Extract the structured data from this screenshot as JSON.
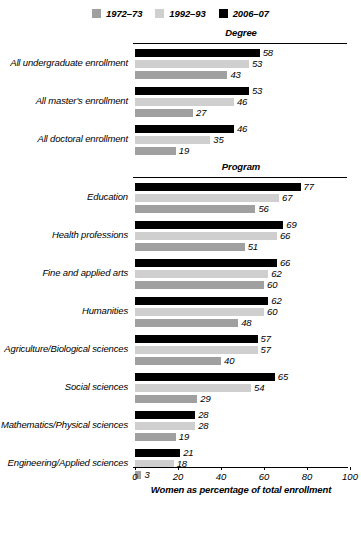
{
  "chart_data": {
    "type": "bar",
    "orientation": "horizontal",
    "title": "",
    "xlabel": "Women as percentage of total enrollment",
    "ylabel": "",
    "xlim": [
      0,
      100
    ],
    "xticks": [
      0,
      20,
      40,
      60,
      80,
      100
    ],
    "grid": false,
    "legend_position": "top-center",
    "series": [
      {
        "name": "1972–73",
        "color": "#a0a0a0",
        "order": 2
      },
      {
        "name": "1992–93",
        "color": "#cfcfcf",
        "order": 1
      },
      {
        "name": "2006–07",
        "color": "#000000",
        "order": 0
      }
    ],
    "sections": [
      {
        "title": "Degree",
        "categories": [
          {
            "label": "All undergraduate enrollment",
            "values": {
              "2006–07": 58,
              "1992–93": 53,
              "1972–73": 43
            }
          },
          {
            "label": "All master's enrollment",
            "values": {
              "2006–07": 53,
              "1992–93": 46,
              "1972–73": 27
            }
          },
          {
            "label": "All doctoral enrollment",
            "values": {
              "2006–07": 46,
              "1992–93": 35,
              "1972–73": 19
            }
          }
        ]
      },
      {
        "title": "Program",
        "categories": [
          {
            "label": "Education",
            "values": {
              "2006–07": 77,
              "1992–93": 67,
              "1972–73": 56
            }
          },
          {
            "label": "Health professions",
            "values": {
              "2006–07": 69,
              "1992–93": 66,
              "1972–73": 51
            }
          },
          {
            "label": "Fine and applied arts",
            "values": {
              "2006–07": 66,
              "1992–93": 62,
              "1972–73": 60
            }
          },
          {
            "label": "Humanities",
            "values": {
              "2006–07": 62,
              "1992–93": 60,
              "1972–73": 48
            }
          },
          {
            "label": "Agriculture/Biological sciences",
            "values": {
              "2006–07": 57,
              "1992–93": 57,
              "1972–73": 40
            }
          },
          {
            "label": "Social sciences",
            "values": {
              "2006–07": 65,
              "1992–93": 54,
              "1972–73": 29
            }
          },
          {
            "label": "Mathematics/Physical sciences",
            "values": {
              "2006–07": 28,
              "1992–93": 28,
              "1972–73": 19
            }
          },
          {
            "label": "Engineering/Applied sciences",
            "values": {
              "2006–07": 21,
              "1992–93": 18,
              "1972–73": 3
            }
          }
        ]
      }
    ]
  }
}
